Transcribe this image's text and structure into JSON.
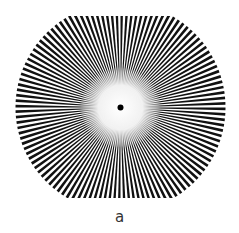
{
  "figure": {
    "type": "siemens-star-test-pattern",
    "caption": "a",
    "spoke_count": 120,
    "center": {
      "x": 120.5,
      "y": 107.5
    },
    "radius": 105,
    "clip_top_y": 16,
    "clip_bottom_y": 198,
    "center_blur_radius": 30,
    "center_dot_radius": 3,
    "colors": {
      "spoke": "#111111",
      "background": "#ffffff",
      "center_dot": "#000000"
    }
  }
}
